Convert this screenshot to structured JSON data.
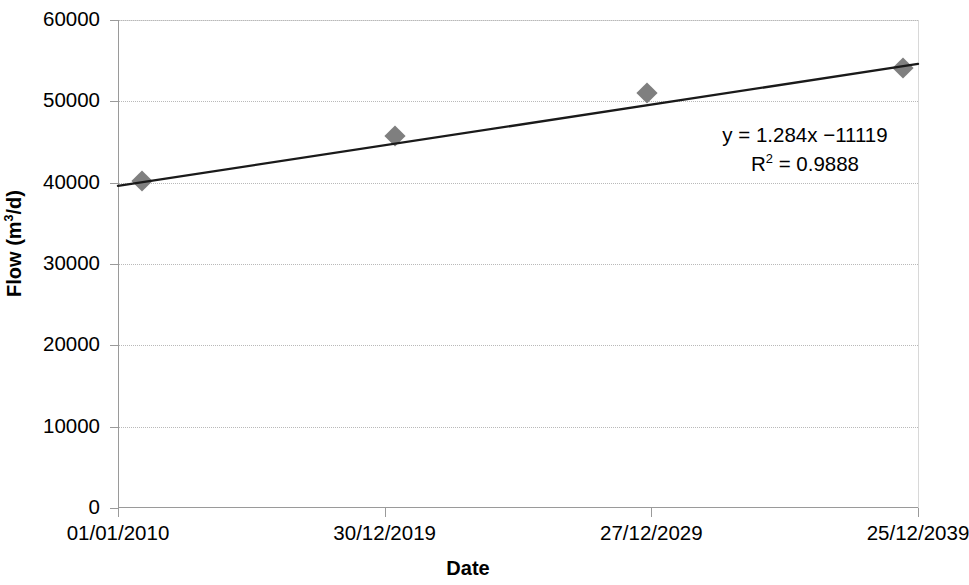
{
  "chart_data": {
    "type": "scatter",
    "title": "",
    "xlabel": "Date",
    "ylabel": "Flow (m3/d)",
    "ylabel_parts": {
      "prefix": "Flow (m",
      "superscript": "3",
      "suffix": "/d)"
    },
    "x_tick_labels": [
      "01/01/2010",
      "30/12/2019",
      "27/12/2029",
      "25/12/2039"
    ],
    "y_tick_labels": [
      "0",
      "10000",
      "20000",
      "30000",
      "40000",
      "50000",
      "60000"
    ],
    "y_tick_values": [
      0,
      10000,
      20000,
      30000,
      40000,
      50000,
      60000
    ],
    "ylim": [
      0,
      60000
    ],
    "xlim": [
      "01/01/2010",
      "25/12/2039"
    ],
    "grid": true,
    "grid_axis": "y",
    "grid_style": "dotted",
    "legend": false,
    "categories": [
      "01/01/2010",
      "30/12/2019",
      "27/12/2029",
      "25/12/2039"
    ],
    "series": [
      {
        "name": "Flow",
        "marker": "diamond",
        "marker_color": "#7f7f7f",
        "x": [
          "01/01/2010",
          "03/2020",
          "06/2030",
          "03/2039"
        ],
        "x_fraction": [
          0.03,
          0.346,
          0.661,
          0.981
        ],
        "values": [
          40200,
          45700,
          51000,
          54100
        ]
      }
    ],
    "trendline": {
      "type": "linear",
      "color": "#1a1a1a",
      "equation": "y = 1.284x −11119",
      "r_squared_label": "R",
      "r_squared_superscript": "2",
      "r_squared_value": "= 0.9888",
      "r_squared": 0.9888,
      "slope": 1.284,
      "intercept": -11119,
      "endpoints": {
        "x0_fraction": 0.0,
        "y0": 39600,
        "x1_fraction": 1.0,
        "y1": 54600
      }
    },
    "annotations": [
      {
        "name": "trendline-equation",
        "text": "y = 1.284x −11119"
      },
      {
        "name": "r-squared",
        "text": "R2 = 0.9888"
      }
    ],
    "colors": {
      "marker": "#7f7f7f",
      "trendline": "#1a1a1a",
      "grid": "#b9b9b9",
      "axis": "#9a9a9a",
      "text": "#000000",
      "background": "#ffffff"
    }
  }
}
